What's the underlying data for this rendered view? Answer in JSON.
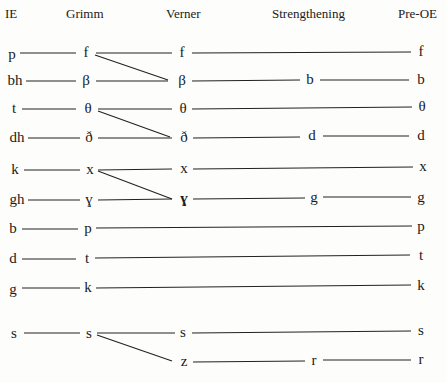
{
  "headers": {
    "ie": "IE",
    "grimm": "Grimm",
    "verner": "Verner",
    "strengthening": "Strengthening",
    "pre_oe": "Pre-OE"
  },
  "rows": [
    {
      "ie": "p",
      "grimm": "f",
      "verner": "f",
      "strengthening": "",
      "pre_oe": "f"
    },
    {
      "ie": "bh",
      "grimm": "β",
      "verner": "β",
      "strengthening": "b",
      "pre_oe": "b"
    },
    {
      "ie": "t",
      "grimm": "θ",
      "verner": "θ",
      "strengthening": "",
      "pre_oe": "θ"
    },
    {
      "ie": "dh",
      "grimm": "ð",
      "verner": "ð",
      "strengthening": "d",
      "pre_oe": "d"
    },
    {
      "ie": "k",
      "grimm": "x",
      "verner": "x",
      "strengthening": "",
      "pre_oe": "x"
    },
    {
      "ie": "gh",
      "grimm": "ɣ",
      "verner": "ɣ",
      "strengthening": "g",
      "pre_oe": "g"
    },
    {
      "ie": "b",
      "grimm": "p",
      "verner": "",
      "strengthening": "",
      "pre_oe": "p"
    },
    {
      "ie": "d",
      "grimm": "t",
      "verner": "",
      "strengthening": "",
      "pre_oe": "t"
    },
    {
      "ie": "g",
      "grimm": "k",
      "verner": "",
      "strengthening": "",
      "pre_oe": "k"
    },
    {
      "ie": "s",
      "grimm": "s",
      "verner": "s",
      "strengthening": "",
      "pre_oe": "s"
    },
    {
      "ie": "",
      "grimm": "",
      "verner": "z",
      "strengthening": "r",
      "pre_oe": "r"
    }
  ],
  "diagonals": [
    {
      "from": "f (Grimm)",
      "to": "β (Verner)"
    },
    {
      "from": "θ (Grimm)",
      "to": "ð (Verner)"
    },
    {
      "from": "x (Grimm)",
      "to": "ɣ (Verner)"
    },
    {
      "from": "s (Grimm)",
      "to": "z (Verner)"
    }
  ]
}
